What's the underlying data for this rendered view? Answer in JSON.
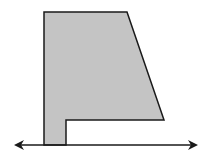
{
  "diagram": {
    "colors": {
      "fill": "#c4c4c4",
      "stroke": "#1a1a1a",
      "background": "#ffffff"
    },
    "shape": {
      "points": "44,12 127,12 164,120 66,120 66,145 44,145"
    },
    "line": {
      "x1": 22,
      "y1": 145,
      "x2": 190,
      "y2": 145,
      "arrows": "both"
    }
  }
}
